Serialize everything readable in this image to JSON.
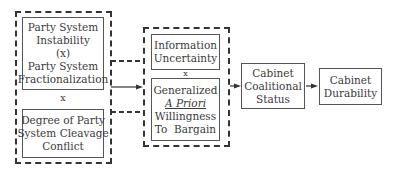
{
  "diagram": {
    "left_group": {
      "top_box": {
        "lines": [
          "Party System",
          "Instability",
          "(x)",
          "Party System",
          "Fractionalization"
        ]
      },
      "operator": "x",
      "bottom_box": {
        "lines": [
          "Degree of Party",
          "System Cleavage",
          "Conflict"
        ]
      }
    },
    "middle_group": {
      "top_box": {
        "lines": [
          "Information",
          "Uncertainty"
        ]
      },
      "operator": "x",
      "bottom_box": {
        "lines": [
          "Generalized",
          "A Priori",
          "Willingness",
          "To  Bargain"
        ]
      }
    },
    "coalitional_box": {
      "lines": [
        "Cabinet",
        "Coalitional",
        "Status"
      ]
    },
    "durability_box": {
      "lines": [
        "Cabinet",
        "Durability"
      ]
    }
  }
}
